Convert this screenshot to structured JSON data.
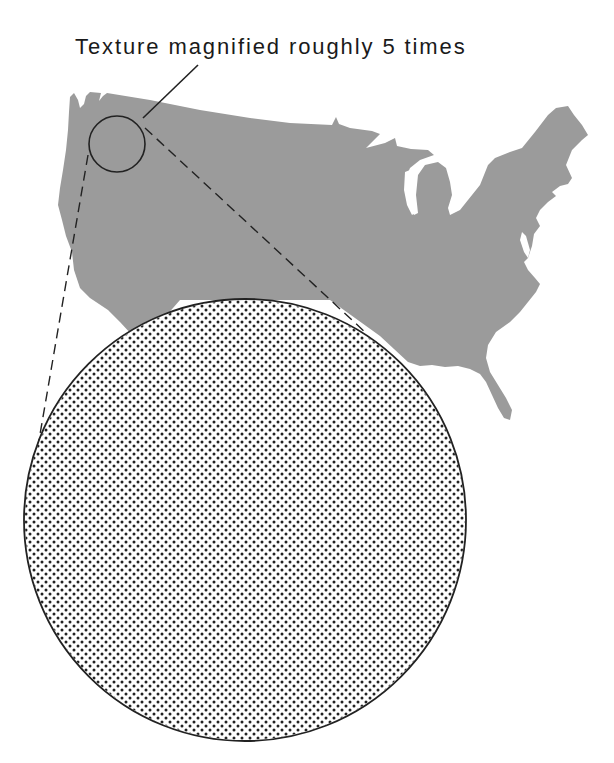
{
  "figure": {
    "caption": "Texture magnified roughly 5 times",
    "colors": {
      "map_fill": "#9b9b9b",
      "outline": "#222222",
      "dot": "#222222",
      "background": "#ffffff"
    },
    "map": {
      "subject": "contiguous United States silhouette",
      "fill": "gray texture"
    },
    "small_circle": {
      "cx": 117,
      "cy": 144,
      "r": 28,
      "label": "sample region (Pacific Northwest)"
    },
    "large_circle": {
      "cx": 245,
      "cy": 520,
      "r": 220,
      "label": "magnified texture (dot pattern)"
    },
    "magnification": "roughly 5 times"
  }
}
